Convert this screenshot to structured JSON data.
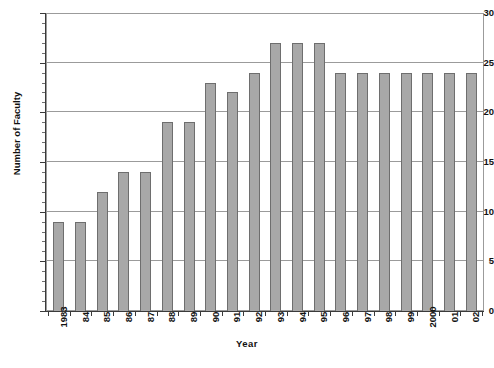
{
  "chart_data": {
    "type": "bar",
    "title": "",
    "xlabel": "Year",
    "ylabel": "Number of Faculty",
    "categories": [
      "1983",
      "84",
      "85",
      "86",
      "87",
      "88",
      "89",
      "90",
      "91",
      "92",
      "93",
      "94",
      "95",
      "96",
      "97",
      "98",
      "99",
      "2000",
      "01",
      "02"
    ],
    "values": [
      9,
      9,
      12,
      14,
      14,
      19,
      19,
      23,
      22,
      24,
      27,
      27,
      27,
      24,
      24,
      24,
      24,
      24,
      24,
      24
    ],
    "ylim": [
      0,
      30
    ],
    "ytick_step": 5,
    "yticks": [
      0,
      5,
      10,
      15,
      20,
      25,
      30
    ],
    "ytick_labels": [
      "0",
      "5",
      "10",
      "15",
      "20",
      "25",
      "30"
    ],
    "grid": "horizontal",
    "legend": "none",
    "bar_color": "#a8a8a8",
    "bar_border_color": "#6e6e6e",
    "gridline_color": "#9b9b9b",
    "axis_color": "#3a3a3a",
    "background": "#ffffff"
  },
  "caption": {
    "fragment": ""
  }
}
